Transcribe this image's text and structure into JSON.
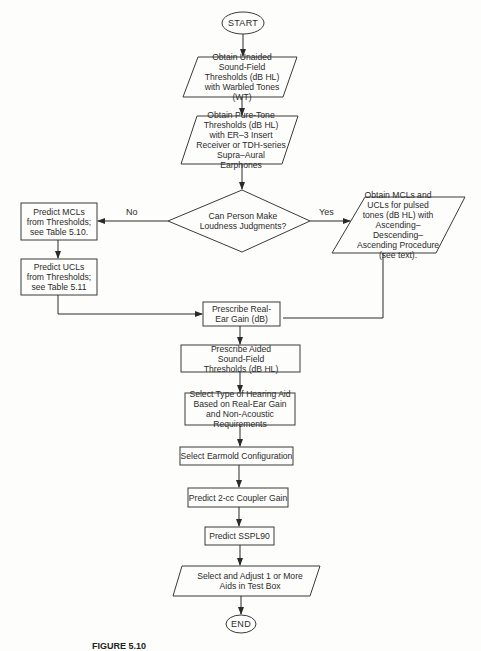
{
  "diagram": {
    "type": "flowchart",
    "nodes": {
      "start": "START",
      "unaided": "Obtain Unaided Sound-Field Thresholds (dB HL) with Warbled Tones (WT)",
      "puretone": "Obtain Pure-Tone Thresholds (dB HL) with ER–3 Insert Receiver or TDH-series Supra–Aural Earphones",
      "decision": "Can Person Make Loudness Judgments?",
      "predict_mcl": "Predict MCLs from Thresholds; see Table 5.10.",
      "predict_ucl": "Predict UCLs from Thresholds; see Table 5.11",
      "obtain_mcl_ucl": "Obtain MCLs and UCLs for pulsed tones (dB HL) with Ascending–Descending–Ascending Procedure (see text).",
      "real_ear_gain": "Prescribe Real-Ear Gain (dB)",
      "aided_thresholds": "Prescribe Aided Sound-Field Thresholds (dB HL)",
      "select_type": "Select Type of Hearing Aid Based on Real-Ear Gain and Non-Acoustic Requirements",
      "earmold": "Select Earmold Configuration",
      "coupler_gain": "Predict 2-cc Coupler Gain",
      "sspl90": "Predict SSPL90",
      "adjust": "Select and Adjust 1 or More Aids in Test Box",
      "end": "END"
    },
    "edge_labels": {
      "no": "No",
      "yes": "Yes"
    },
    "edges": [
      [
        "start",
        "unaided"
      ],
      [
        "unaided",
        "puretone"
      ],
      [
        "puretone",
        "decision"
      ],
      [
        "decision",
        "predict_mcl",
        "No"
      ],
      [
        "decision",
        "obtain_mcl_ucl",
        "Yes"
      ],
      [
        "predict_mcl",
        "predict_ucl"
      ],
      [
        "predict_ucl",
        "real_ear_gain"
      ],
      [
        "obtain_mcl_ucl",
        "real_ear_gain"
      ],
      [
        "real_ear_gain",
        "aided_thresholds"
      ],
      [
        "aided_thresholds",
        "select_type"
      ],
      [
        "select_type",
        "earmold"
      ],
      [
        "earmold",
        "coupler_gain"
      ],
      [
        "coupler_gain",
        "sspl90"
      ],
      [
        "sspl90",
        "adjust"
      ],
      [
        "adjust",
        "end"
      ]
    ],
    "caption": "FIGURE 5.10"
  }
}
